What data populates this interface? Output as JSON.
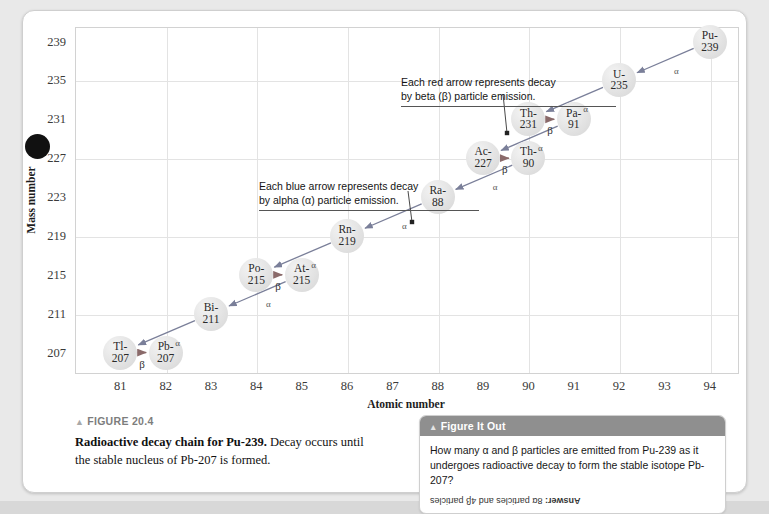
{
  "figure": {
    "label_prefix": "FIGURE 20.4",
    "caption_bold": "Radioactive decay chain for Pu-239.",
    "caption_rest": " Decay occurs until the stable nucleus of Pb-207 is formed."
  },
  "chart_data": {
    "type": "scatter",
    "title": "Radioactive decay chain for Pu-239",
    "xlabel": "Atomic number",
    "ylabel": "Mass number",
    "xlim": [
      80,
      94.6
    ],
    "ylim": [
      205,
      240.5
    ],
    "xticks": [
      81,
      82,
      83,
      84,
      85,
      86,
      87,
      88,
      89,
      90,
      91,
      92,
      93,
      94
    ],
    "yticks": [
      207,
      211,
      215,
      219,
      223,
      227,
      231,
      235,
      239
    ],
    "grid": true,
    "gridlines_x": [
      82,
      84,
      86,
      88,
      90,
      92,
      94
    ],
    "gridlines_y": [
      211,
      219,
      227,
      235
    ],
    "nodes": [
      {
        "id": "pu-239",
        "label_top": "Pu-",
        "label_bottom": "239",
        "x": 94,
        "y": 239
      },
      {
        "id": "u-235",
        "label_top": "U-",
        "label_bottom": "235",
        "x": 92,
        "y": 235
      },
      {
        "id": "th-231",
        "label_top": "Th-",
        "label_bottom": "231",
        "x": 90,
        "y": 231
      },
      {
        "id": "pa-91",
        "label_top": "Pa-",
        "label_bottom": "91",
        "x": 91,
        "y": 231
      },
      {
        "id": "ac-227",
        "label_top": "Ac-",
        "label_bottom": "227",
        "x": 89,
        "y": 227
      },
      {
        "id": "th-90",
        "label_top": "Th-",
        "label_bottom": "90",
        "x": 90,
        "y": 227
      },
      {
        "id": "ra-88",
        "label_top": "Ra-",
        "label_bottom": "88",
        "x": 88,
        "y": 223
      },
      {
        "id": "rn-219",
        "label_top": "Rn-",
        "label_bottom": "219",
        "x": 86,
        "y": 219
      },
      {
        "id": "po-215",
        "label_top": "Po-",
        "label_bottom": "215",
        "x": 84,
        "y": 215
      },
      {
        "id": "at-215",
        "label_top": "At-",
        "label_bottom": "215",
        "x": 85,
        "y": 215
      },
      {
        "id": "bi-211",
        "label_top": "Bi-",
        "label_bottom": "211",
        "x": 83,
        "y": 211
      },
      {
        "id": "tl-207",
        "label_top": "Tl-",
        "label_bottom": "207",
        "x": 81,
        "y": 207
      },
      {
        "id": "pb-207",
        "label_top": "Pb-",
        "label_bottom": "207",
        "x": 82,
        "y": 207
      }
    ],
    "decays": [
      {
        "from": "pu-239",
        "to": "u-235",
        "type": "alpha",
        "symbol": "α",
        "color": "#7a7f99"
      },
      {
        "from": "u-235",
        "to": "th-231",
        "type": "alpha",
        "symbol": "α",
        "color": "#7a7f99"
      },
      {
        "from": "th-231",
        "to": "pa-91",
        "type": "beta",
        "symbol": "β",
        "color": "#8a6a6a"
      },
      {
        "from": "pa-91",
        "to": "ac-227",
        "type": "alpha",
        "symbol": "α",
        "color": "#7a7f99"
      },
      {
        "from": "ac-227",
        "to": "th-90",
        "type": "beta",
        "symbol": "β",
        "color": "#8a6a6a"
      },
      {
        "from": "th-90",
        "to": "ra-88",
        "type": "alpha",
        "symbol": "α",
        "color": "#7a7f99"
      },
      {
        "from": "ra-88",
        "to": "rn-219",
        "type": "alpha",
        "symbol": "α",
        "color": "#7a7f99"
      },
      {
        "from": "rn-219",
        "to": "po-215",
        "type": "alpha",
        "symbol": "α",
        "color": "#7a7f99"
      },
      {
        "from": "po-215",
        "to": "at-215",
        "type": "beta",
        "symbol": "β",
        "color": "#8a6a6a"
      },
      {
        "from": "at-215",
        "to": "bi-211",
        "type": "alpha",
        "symbol": "α",
        "color": "#7a7f99"
      },
      {
        "from": "bi-211",
        "to": "tl-207",
        "type": "alpha",
        "symbol": "α",
        "color": "#7a7f99"
      },
      {
        "from": "tl-207",
        "to": "pb-207",
        "type": "beta",
        "symbol": "β",
        "color": "#8a6a6a"
      }
    ],
    "annotations": [
      {
        "id": "red-note",
        "line1": "Each red arrow represents decay",
        "line2": "by beta (β) particle emission."
      },
      {
        "id": "blue-note",
        "line1": "Each blue arrow represents decay",
        "line2": "by alpha (α) particle emission."
      }
    ]
  },
  "figure_it_out": {
    "header": "Figure It Out",
    "question_line1": "How many α and β particles are emitted from Pu-239 as it",
    "question_line2": "undergoes radioactive decay to form the stable isotope Pb-207?",
    "answer_prefix": "Answer:",
    "answer_text": " 8α particles and 4β particles"
  }
}
